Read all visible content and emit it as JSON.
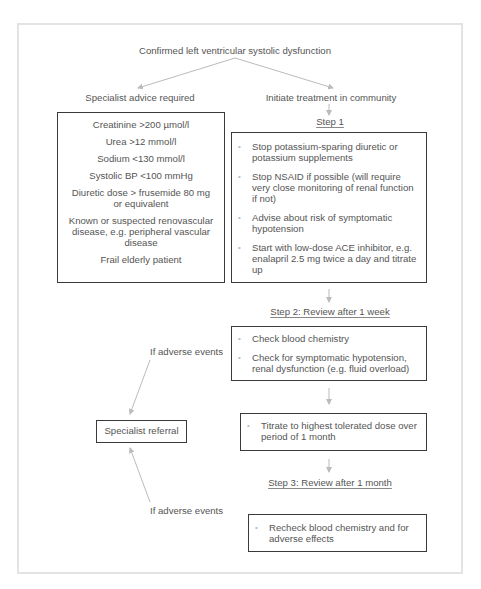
{
  "title": "Confirmed left ventricular systolic dysfunction",
  "branches": {
    "left": "Specialist advice required",
    "right": "Initiate treatment in community"
  },
  "specialist_criteria": [
    "Creatinine >200 µmol/l",
    "Urea >12 mmol/l",
    "Sodium <130 mmol/l",
    "Systolic BP <100 mmHg",
    "Diuretic dose > frusemide 80 mg or equivalent",
    "Known or suspected renovascular disease, e.g. peripheral vascular disease",
    "Frail elderly patient"
  ],
  "step1": {
    "label": "Step 1",
    "items": [
      "Stop potassium-sparing diuretic or potassium supplements",
      "Stop NSAID if possible (will require very close monitoring of renal function if not)",
      "Advise about risk of symptomatic hypotension",
      "Start with low-dose ACE inhibitor, e.g. enalapril 2.5 mg twice a day and titrate up"
    ]
  },
  "step2": {
    "label": "Step 2: Review after 1 week",
    "items": [
      "Check blood chemistry",
      "Check for symptomatic hypotension, renal dysfunction (e.g. fluid overload)"
    ]
  },
  "titrate": {
    "items": [
      "Titrate to highest tolerated dose over period of 1 month"
    ]
  },
  "step3": {
    "label": "Step 3: Review after 1 month",
    "items": [
      "Recheck blood chemistry and for adverse effects"
    ]
  },
  "referral": {
    "label": "Specialist referral",
    "adverse_upper": "If adverse events",
    "adverse_lower": "If adverse events"
  },
  "colors": {
    "text": "#555555",
    "box_border": "#3a3a3a",
    "arrow": "#bbbbbb",
    "frame": "#e3e3e3"
  },
  "bullet_glyph": "•"
}
